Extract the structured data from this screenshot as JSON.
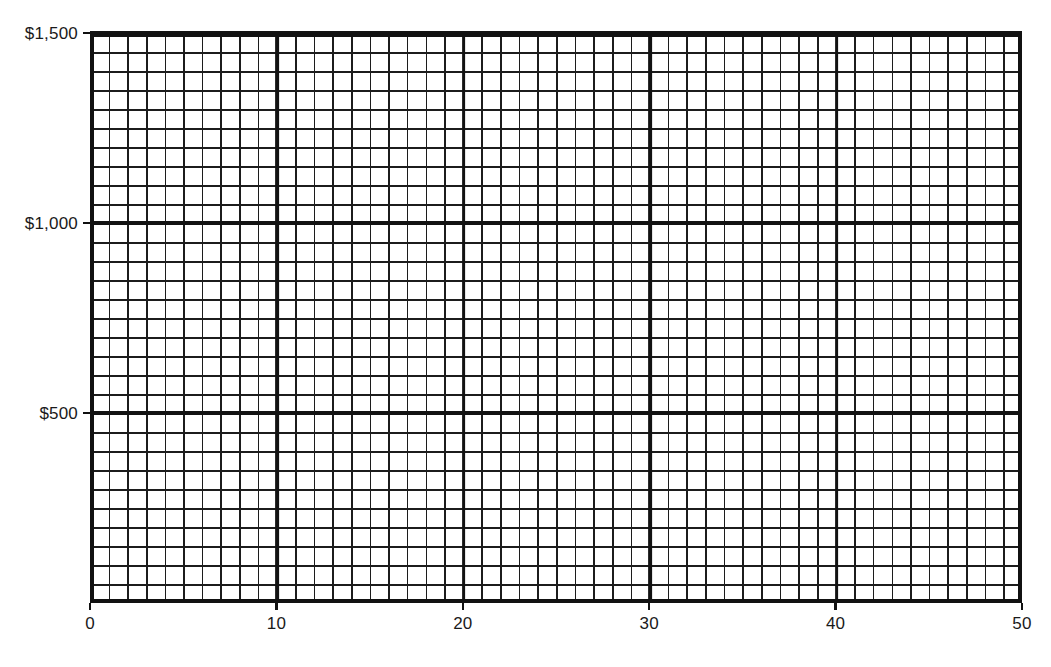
{
  "chart_data": {
    "type": "line",
    "title": "",
    "subtitle": "",
    "xlabel": "",
    "ylabel": "",
    "series": [],
    "x": [],
    "xlim": [
      0,
      50
    ],
    "ylim": [
      0,
      1500
    ],
    "grid": true,
    "legend": null,
    "annotations": [],
    "x_axis": {
      "min": 0,
      "max": 50,
      "major_step": 10,
      "minor_step": 1,
      "tick_labels": [
        "0",
        "10",
        "20",
        "30",
        "40",
        "50"
      ],
      "tick_values": [
        0,
        10,
        20,
        30,
        40,
        50
      ]
    },
    "y_axis": {
      "min": 0,
      "max": 1500,
      "major_step": 500,
      "minor_step": 50,
      "tick_labels": [
        "$1,500",
        "$1,000",
        "$500"
      ],
      "tick_values": [
        1500,
        1000,
        500
      ],
      "currency_prefix": "$"
    }
  },
  "axes": {
    "y_ticks": [
      {
        "label": "$1,500",
        "value": 1500
      },
      {
        "label": "$1,000",
        "value": 1000
      },
      {
        "label": "$500",
        "value": 500
      }
    ],
    "x_ticks": [
      {
        "label": "0",
        "value": 0
      },
      {
        "label": "10",
        "value": 10
      },
      {
        "label": "20",
        "value": 20
      },
      {
        "label": "30",
        "value": 30
      },
      {
        "label": "40",
        "value": 40
      },
      {
        "label": "50",
        "value": 50
      }
    ]
  },
  "colors": {
    "background": "#ffffff",
    "grid_minor": "#1c1c1c",
    "grid_major": "#121212",
    "frame": "#111111",
    "text": "#1a1a1a"
  }
}
